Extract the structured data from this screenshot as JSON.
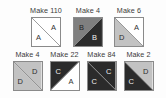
{
  "page": {
    "background_color": "#fdfdfd"
  },
  "palette": {
    "white": "#ffffff",
    "light_gray": "#c2c2c2",
    "medium_gray": "#7f7f7f",
    "dark": "#2b2b2b",
    "outline": "#8a8a8a",
    "label_text": "#3a3a3a"
  },
  "rows": [
    {
      "name": "top-row",
      "units": [
        {
          "label": "Make 110",
          "diagonal": "tlbr",
          "halves": [
            {
              "position": "upper-right",
              "letter": "A",
              "fill": "#ffffff",
              "text_color": "#333333"
            },
            {
              "position": "lower-left",
              "letter": "A",
              "fill": "#ffffff",
              "text_color": "#333333"
            }
          ]
        },
        {
          "label": "Make 4",
          "diagonal": "trbl",
          "halves": [
            {
              "position": "upper-left",
              "letter": "B",
              "fill": "#7f7f7f",
              "text_color": "#1f1f1f"
            },
            {
              "position": "lower-right",
              "letter": "B",
              "fill": "#2b2b2b",
              "text_color": "#f0f0f0"
            }
          ]
        },
        {
          "label": "Make 6",
          "diagonal": "tlbr",
          "halves": [
            {
              "position": "upper-right",
              "letter": "A",
              "fill": "#ffffff",
              "text_color": "#333333"
            },
            {
              "position": "lower-left",
              "letter": "D",
              "fill": "#c2c2c2",
              "text_color": "#2b2b2b"
            }
          ]
        }
      ]
    },
    {
      "name": "bottom-row",
      "units": [
        {
          "label": "Make 4",
          "diagonal": "tlbr",
          "halves": [
            {
              "position": "upper-right",
              "letter": "D",
              "fill": "#c2c2c2",
              "text_color": "#2b2b2b"
            },
            {
              "position": "lower-left",
              "letter": "D",
              "fill": "#c2c2c2",
              "text_color": "#2b2b2b"
            }
          ]
        },
        {
          "label": "Make 22",
          "diagonal": "trbl",
          "halves": [
            {
              "position": "upper-left",
              "letter": "C",
              "fill": "#2b2b2b",
              "text_color": "#f0f0f0"
            },
            {
              "position": "lower-right",
              "letter": "A",
              "fill": "#ffffff",
              "text_color": "#333333"
            }
          ]
        },
        {
          "label": "Make 84",
          "diagonal": "tlbr",
          "halves": [
            {
              "position": "upper-right",
              "letter": "C",
              "fill": "#2b2b2b",
              "text_color": "#f0f0f0"
            },
            {
              "position": "lower-left",
              "letter": "C",
              "fill": "#2b2b2b",
              "text_color": "#f0f0f0"
            }
          ]
        },
        {
          "label": "Make 2",
          "diagonal": "tlbr",
          "halves": [
            {
              "position": "upper-right",
              "letter": "D",
              "fill": "#c2c2c2",
              "text_color": "#2b2b2b"
            },
            {
              "position": "lower-left",
              "letter": "C",
              "fill": "#2b2b2b",
              "text_color": "#f0f0f0"
            }
          ]
        }
      ]
    }
  ]
}
